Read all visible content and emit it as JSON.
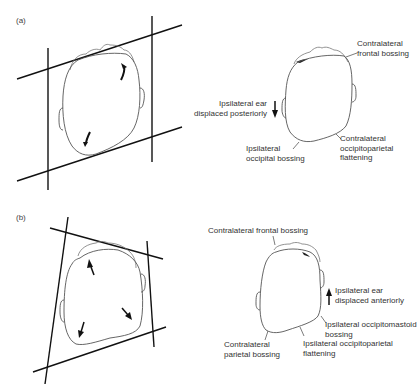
{
  "figure": {
    "panels": [
      {
        "id": "a",
        "label": "(a)",
        "left_diagram": {
          "description": "Parallelogram-shaped head with bounding lines",
          "arrows": [
            "rotational-arrow-top-right",
            "rotational-arrow-bottom-left"
          ]
        },
        "right_diagram": {
          "annotations": {
            "contralateral_frontal_bossing": [
              "Contralateral",
              "frontal bossing"
            ],
            "ipsilateral_ear": [
              "Ipsilateral ear",
              "displaced posteriorly"
            ],
            "ipsilateral_occipital_bossing": [
              "Ipsilateral",
              "occipital bossing"
            ],
            "contralateral_occipitoparietal_flattening": [
              "Contralateral",
              "occipitoparietal",
              "flattening"
            ]
          },
          "ear_arrow_direction": "down"
        }
      },
      {
        "id": "b",
        "label": "(b)",
        "left_diagram": {
          "description": "Trapezoid-shaped head with bounding lines",
          "arrows": [
            "outward-arrow-top",
            "outward-arrow-bottom-left",
            "outward-arrow-bottom-right"
          ]
        },
        "right_diagram": {
          "annotations": {
            "contralateral_frontal_bossing": [
              "Contralateral frontal bossing"
            ],
            "ipsilateral_ear": [
              "Ipsilateral ear",
              "displaced anteriorly"
            ],
            "ipsilateral_occipitomastoid_bossing": [
              "Ipsilateral occipitomastoid",
              "bossing"
            ],
            "contralateral_parietal_bossing": [
              "Contralateral",
              "parietal bossing"
            ],
            "ipsilateral_occipitoparietal_flattening": [
              "Ipsilateral occipitoparietal",
              "flattening"
            ]
          },
          "ear_arrow_direction": "up"
        }
      }
    ]
  }
}
